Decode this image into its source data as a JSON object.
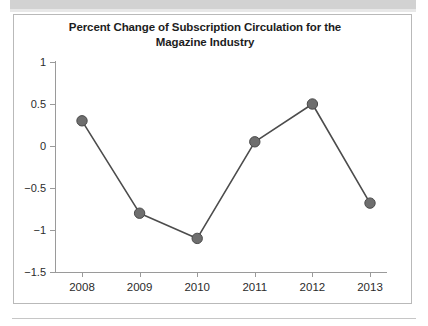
{
  "figure": {
    "banner_present": true,
    "border_color": "#b9b9b9",
    "background": "#ffffff"
  },
  "chart_data": {
    "type": "line",
    "title": "Percent Change of Subscription Circulation for the Magazine Industry",
    "title_line1": "Percent Change of Subscription Circulation for the",
    "title_line2": "Magazine Industry",
    "xlabel": "",
    "ylabel": "",
    "categories": [
      "2008",
      "2009",
      "2010",
      "2011",
      "2012",
      "2013"
    ],
    "values": [
      0.3,
      -0.8,
      -1.1,
      0.05,
      0.5,
      -0.68
    ],
    "x": [
      2008,
      2009,
      2010,
      2011,
      2012,
      2013
    ],
    "ylim": [
      -1.5,
      1
    ],
    "xlim": [
      2007.6,
      2013.4
    ],
    "yticks": [
      1,
      0.5,
      0,
      -0.5,
      -1,
      -1.5
    ],
    "ytick_labels": [
      "1",
      "0.5",
      "0",
      "−0.5",
      "−1",
      "−1.5"
    ],
    "xtick_labels": [
      "2008",
      "2009",
      "2010",
      "2011",
      "2012",
      "2013"
    ],
    "grid": false,
    "legend": false,
    "legend_position": "none",
    "marker": "circle",
    "marker_color": "#6e6e6e",
    "marker_edge_color": "#4a4a4a",
    "line_color": "#4c4c4c",
    "axis_color": "#9a9a9a",
    "text_color": "#2b2b2b"
  }
}
